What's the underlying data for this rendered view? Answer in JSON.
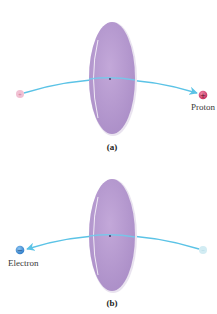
{
  "panels": [
    {
      "id": "a",
      "caption": "(a)",
      "particle_label": "Proton",
      "particle_sign": "+",
      "direction": "left-to-right",
      "particle_color": "#d6406e",
      "ghost_color": "#e9a6c3"
    },
    {
      "id": "b",
      "caption": "(b)",
      "particle_label": "Electron",
      "particle_sign": "−",
      "direction": "right-to-left",
      "particle_color": "#3f8fd8",
      "ghost_color": "#bfe3ef"
    }
  ],
  "colors": {
    "sheet_fill": "#b89bd0",
    "sheet_edge": "#ffffff",
    "trajectory": "#5bc3e6"
  }
}
